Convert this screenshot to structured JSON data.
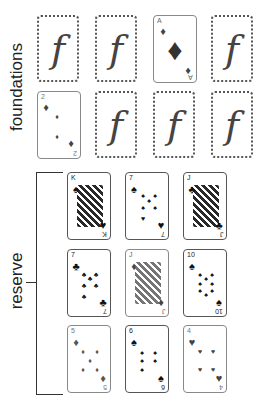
{
  "labels": {
    "foundations": "foundations",
    "reserve": "reserve",
    "empty_glyph": "f"
  },
  "colors": {
    "black_suit": "#111111",
    "red_suit_muted": "#555555",
    "card_border": "#555555"
  },
  "foundations": [
    {
      "id": "f1",
      "state": "empty"
    },
    {
      "id": "f2",
      "state": "empty"
    },
    {
      "id": "f3",
      "state": "card",
      "rank": "A",
      "suit": "diamonds",
      "suit_glyph": "♦"
    },
    {
      "id": "f4",
      "state": "empty"
    },
    {
      "id": "f5",
      "state": "card",
      "rank": "2",
      "suit": "diamonds",
      "suit_glyph": "♦"
    },
    {
      "id": "f6",
      "state": "empty"
    },
    {
      "id": "f7",
      "state": "empty"
    },
    {
      "id": "f8",
      "state": "empty"
    }
  ],
  "reserve": [
    {
      "rank": "K",
      "suit": "spades",
      "suit_glyph": "♠"
    },
    {
      "rank": "7",
      "suit": "spades",
      "suit_glyph": "♠"
    },
    {
      "rank": "J",
      "suit": "clubs",
      "suit_glyph": "♣"
    },
    {
      "rank": "7",
      "suit": "clubs",
      "suit_glyph": "♣"
    },
    {
      "rank": "J",
      "suit": "diamonds",
      "suit_glyph": "♦"
    },
    {
      "rank": "10",
      "suit": "spades",
      "suit_glyph": "♠"
    },
    {
      "rank": "5",
      "suit": "diamonds",
      "suit_glyph": "♦"
    },
    {
      "rank": "6",
      "suit": "spades",
      "suit_glyph": "♠"
    },
    {
      "rank": "4",
      "suit": "hearts",
      "suit_glyph": "♥"
    }
  ]
}
